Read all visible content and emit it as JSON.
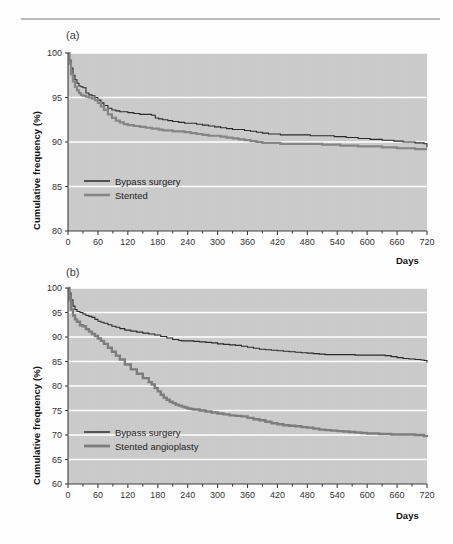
{
  "figure": {
    "rule_color": "#b9b9b9",
    "plot_bg": "#c9c9c9",
    "grid_color": "#ffffff",
    "axis_color": "#3f3f3f",
    "tick_text_color": "#333333"
  },
  "panels": [
    {
      "id": "a",
      "label": "(a)",
      "chart_data": {
        "type": "line",
        "title": "",
        "subtitle": "",
        "xlabel": "Days",
        "ylabel": "Cumulative frequency (%)",
        "xlim": [
          0,
          720
        ],
        "ylim": [
          80,
          100
        ],
        "xticks": [
          0,
          60,
          120,
          180,
          240,
          300,
          360,
          420,
          480,
          540,
          600,
          660,
          720
        ],
        "xticklabels": [
          "0",
          "60",
          "120",
          "180",
          "240",
          "300",
          "360",
          "420",
          "480",
          "540",
          "600",
          "660",
          "720"
        ],
        "yticks": [
          80,
          85,
          90,
          95,
          100
        ],
        "yticklabels": [
          "80",
          "85",
          "90",
          "95",
          "100"
        ],
        "grid": "horizontal",
        "legend_position": "lower-left",
        "series": [
          {
            "name": "Bypass surgery",
            "color": "#2b2b2b",
            "width": 1.1,
            "x": [
              0,
              3,
              6,
              10,
              14,
              18,
              22,
              26,
              30,
              36,
              42,
              48,
              54,
              60,
              66,
              72,
              80,
              88,
              96,
              104,
              112,
              120,
              132,
              144,
              156,
              168,
              175,
              182,
              190,
              200,
              210,
              222,
              234,
              246,
              258,
              270,
              282,
              294,
              306,
              318,
              330,
              342,
              354,
              366,
              378,
              390,
              402,
              414,
              426,
              438,
              450,
              462,
              474,
              486,
              498,
              510,
              522,
              534,
              546,
              558,
              570,
              582,
              594,
              606,
              618,
              630,
              642,
              654,
              660,
              672,
              684,
              696,
              708,
              714,
              720
            ],
            "y": [
              100.0,
              99.2,
              98.3,
              97.5,
              97.0,
              96.6,
              96.3,
              96.2,
              96.1,
              95.5,
              95.3,
              95.2,
              95.0,
              94.7,
              94.4,
              94.1,
              93.8,
              93.6,
              93.5,
              93.4,
              93.4,
              93.3,
              93.2,
              93.1,
              93.1,
              93.0,
              92.7,
              92.6,
              92.5,
              92.4,
              92.3,
              92.2,
              92.1,
              92.1,
              92.0,
              91.9,
              91.8,
              91.7,
              91.6,
              91.5,
              91.4,
              91.4,
              91.3,
              91.2,
              91.1,
              91.0,
              90.9,
              90.9,
              90.8,
              90.8,
              90.8,
              90.8,
              90.8,
              90.7,
              90.7,
              90.7,
              90.7,
              90.6,
              90.6,
              90.5,
              90.5,
              90.4,
              90.4,
              90.3,
              90.3,
              90.2,
              90.2,
              90.1,
              90.1,
              90.0,
              90.0,
              89.9,
              89.9,
              89.8,
              89.4
            ]
          },
          {
            "name": "Stented",
            "color": "#858585",
            "width": 2.2,
            "x": [
              0,
              3,
              6,
              10,
              14,
              18,
              22,
              26,
              30,
              36,
              42,
              48,
              54,
              60,
              66,
              72,
              80,
              88,
              96,
              104,
              112,
              120,
              132,
              144,
              156,
              168,
              175,
              182,
              190,
              200,
              210,
              222,
              234,
              246,
              258,
              270,
              282,
              294,
              306,
              318,
              330,
              342,
              354,
              366,
              378,
              390,
              402,
              414,
              426,
              438,
              450,
              462,
              474,
              486,
              498,
              510,
              522,
              534,
              546,
              558,
              570,
              582,
              594,
              606,
              618,
              630,
              642,
              654,
              660,
              672,
              684,
              696,
              708,
              714,
              720
            ],
            "y": [
              100.0,
              98.8,
              97.6,
              96.8,
              96.2,
              95.8,
              95.5,
              95.3,
              95.2,
              95.1,
              95.0,
              94.9,
              94.7,
              94.4,
              94.0,
              93.6,
              93.1,
              92.7,
              92.4,
              92.2,
              92.0,
              91.9,
              91.8,
              91.7,
              91.6,
              91.5,
              91.5,
              91.4,
              91.3,
              91.3,
              91.2,
              91.2,
              91.1,
              91.0,
              90.9,
              90.8,
              90.7,
              90.7,
              90.6,
              90.5,
              90.4,
              90.3,
              90.2,
              90.1,
              90.0,
              89.9,
              89.9,
              89.9,
              89.8,
              89.8,
              89.8,
              89.8,
              89.8,
              89.8,
              89.8,
              89.7,
              89.7,
              89.7,
              89.6,
              89.6,
              89.6,
              89.5,
              89.5,
              89.5,
              89.5,
              89.4,
              89.4,
              89.4,
              89.3,
              89.3,
              89.3,
              89.2,
              89.2,
              89.2,
              89.2
            ]
          }
        ]
      }
    },
    {
      "id": "b",
      "label": "(b)",
      "chart_data": {
        "type": "line",
        "title": "",
        "subtitle": "",
        "xlabel": "Days",
        "ylabel": "Cumulative frequency (%)",
        "xlim": [
          0,
          720
        ],
        "ylim": [
          60,
          100
        ],
        "xticks": [
          0,
          60,
          120,
          180,
          240,
          300,
          360,
          420,
          480,
          540,
          600,
          660,
          720
        ],
        "xticklabels": [
          "0",
          "60",
          "120",
          "180",
          "240",
          "300",
          "360",
          "420",
          "480",
          "540",
          "600",
          "660",
          "720"
        ],
        "yticks": [
          60,
          65,
          70,
          75,
          80,
          85,
          90,
          95,
          100
        ],
        "yticklabels": [
          "60",
          "65",
          "70",
          "75",
          "80",
          "85",
          "90",
          "95",
          "100"
        ],
        "grid": "horizontal",
        "legend_position": "lower-left",
        "series": [
          {
            "name": "Bypass surgery",
            "color": "#2b2b2b",
            "width": 1.1,
            "x": [
              0,
              3,
              6,
              10,
              14,
              18,
              24,
              30,
              36,
              42,
              48,
              54,
              60,
              66,
              72,
              80,
              88,
              96,
              104,
              114,
              126,
              138,
              150,
              162,
              174,
              186,
              198,
              210,
              222,
              228,
              240,
              252,
              264,
              276,
              288,
              300,
              312,
              324,
              336,
              348,
              360,
              372,
              384,
              396,
              408,
              420,
              432,
              444,
              456,
              468,
              480,
              492,
              504,
              516,
              528,
              540,
              552,
              564,
              576,
              588,
              600,
              612,
              624,
              636,
              648,
              660,
              672,
              684,
              696,
              708,
              714,
              720
            ],
            "y": [
              100.0,
              99.0,
              97.6,
              96.3,
              95.6,
              95.2,
              95.0,
              94.7,
              94.4,
              94.2,
              94.0,
              93.6,
              93.2,
              93.0,
              92.8,
              92.5,
              92.2,
              92.0,
              91.7,
              91.4,
              91.2,
              91.0,
              90.8,
              90.6,
              90.4,
              90.1,
              89.8,
              89.5,
              89.3,
              89.2,
              89.2,
              89.1,
              89.0,
              88.9,
              88.8,
              88.6,
              88.5,
              88.4,
              88.3,
              88.1,
              87.9,
              87.7,
              87.5,
              87.4,
              87.3,
              87.2,
              87.1,
              87.0,
              86.9,
              86.8,
              86.7,
              86.6,
              86.5,
              86.4,
              86.4,
              86.4,
              86.4,
              86.4,
              86.3,
              86.3,
              86.3,
              86.3,
              86.3,
              86.2,
              86.0,
              85.8,
              85.6,
              85.5,
              85.4,
              85.3,
              85.2,
              84.8
            ]
          },
          {
            "name": "Stented angioplasty",
            "color": "#7d7d7d",
            "width": 2.4,
            "x": [
              0,
              3,
              6,
              10,
              14,
              18,
              24,
              30,
              36,
              42,
              48,
              54,
              60,
              66,
              72,
              80,
              88,
              96,
              104,
              114,
              126,
              138,
              150,
              162,
              168,
              174,
              180,
              186,
              192,
              198,
              204,
              210,
              216,
              222,
              228,
              234,
              240,
              246,
              252,
              264,
              276,
              288,
              300,
              312,
              324,
              336,
              348,
              360,
              372,
              384,
              396,
              408,
              420,
              432,
              444,
              456,
              468,
              480,
              492,
              504,
              516,
              528,
              540,
              552,
              564,
              576,
              588,
              600,
              612,
              624,
              636,
              648,
              660,
              672,
              684,
              696,
              708,
              714,
              720
            ],
            "y": [
              100.0,
              97.5,
              95.6,
              94.4,
              93.6,
              93.1,
              92.4,
              92.2,
              91.6,
              91.1,
              90.6,
              90.2,
              89.7,
              89.2,
              88.6,
              87.8,
              87.0,
              86.2,
              85.4,
              84.4,
              83.4,
              82.5,
              81.6,
              80.8,
              80.3,
              79.6,
              78.9,
              78.2,
              77.6,
              77.2,
              76.8,
              76.5,
              76.2,
              76.0,
              75.8,
              75.6,
              75.4,
              75.3,
              75.2,
              75.0,
              74.8,
              74.6,
              74.4,
              74.2,
              74.0,
              73.9,
              73.8,
              73.5,
              73.2,
              73.0,
              72.7,
              72.4,
              72.2,
              72.0,
              71.9,
              71.8,
              71.6,
              71.5,
              71.3,
              71.1,
              71.0,
              70.9,
              70.8,
              70.7,
              70.6,
              70.5,
              70.4,
              70.3,
              70.3,
              70.2,
              70.2,
              70.1,
              70.1,
              70.1,
              70.1,
              70.0,
              70.0,
              69.8,
              69.6
            ]
          }
        ]
      }
    }
  ]
}
